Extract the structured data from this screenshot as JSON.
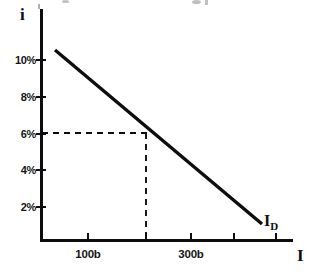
{
  "figure": {
    "background_color": "#ffffff",
    "ink_color": "#0d0d0d",
    "width": 330,
    "height": 276
  },
  "axes": {
    "y_title": "i",
    "x_title": "I",
    "curve_label_main": "I",
    "curve_label_sub": "D"
  },
  "y_ticks": [
    {
      "label": "10%",
      "value": 10,
      "y": 60
    },
    {
      "label": "8%",
      "value": 8,
      "y": 97
    },
    {
      "label": "6%",
      "value": 6,
      "y": 134
    },
    {
      "label": "4%",
      "value": 4,
      "y": 170
    },
    {
      "label": "2%",
      "value": 2,
      "y": 207
    }
  ],
  "x_ticks": [
    {
      "label": "100b",
      "x": 88
    },
    {
      "label": "",
      "x": 146
    },
    {
      "label": "300b",
      "x": 191
    },
    {
      "label": "",
      "x": 234
    },
    {
      "label": "",
      "x": 276
    }
  ],
  "chart_data": {
    "type": "line",
    "title": "",
    "subtitle": "",
    "xlabel": "I",
    "ylabel": "i",
    "grid": false,
    "legend": "none",
    "xlim": [
      0,
      430
    ],
    "ylim": [
      0,
      11.8
    ],
    "x_tick_labels": [
      "100b",
      "300b"
    ],
    "y_tick_labels": [
      "10%",
      "8%",
      "6%",
      "4%",
      "2%"
    ],
    "series": [
      {
        "name": "I_D",
        "type": "line",
        "style": "solid",
        "linewidth": 3,
        "annotation": "I_D",
        "points": [
          {
            "x": 25,
            "y": 10.5
          },
          {
            "x": 380,
            "y": 0.9
          }
        ]
      },
      {
        "name": "equilibrium-guide-horizontal",
        "type": "line",
        "style": "dashed",
        "linewidth": 1.6,
        "points": [
          {
            "x": 0,
            "y": 6.05
          },
          {
            "x": 205,
            "y": 6.05
          }
        ]
      },
      {
        "name": "equilibrium-guide-vertical",
        "type": "line",
        "style": "dashed",
        "linewidth": 1.6,
        "points": [
          {
            "x": 205,
            "y": 6.05
          },
          {
            "x": 205,
            "y": 0
          }
        ]
      }
    ],
    "annotations": [
      {
        "text": "I_D",
        "x": 380,
        "y": 0.9,
        "note": "curve name at lower right end of demand line"
      }
    ],
    "equilibrium_point": {
      "interest_rate": "6%",
      "investment": "205b"
    }
  },
  "pixel_geometry": {
    "y_axis_x": 41,
    "x_axis_y": 240,
    "plot_left": 41,
    "plot_right": 292,
    "plot_top": 9,
    "line_start": {
      "x": 55,
      "y": 50
    },
    "line_end": {
      "x": 262,
      "y": 224
    },
    "dash_h_y": 133,
    "dash_h_x1": 42,
    "dash_h_x2": 147,
    "dash_v_x": 146,
    "dash_v_y1": 133,
    "dash_v_y2": 240
  }
}
